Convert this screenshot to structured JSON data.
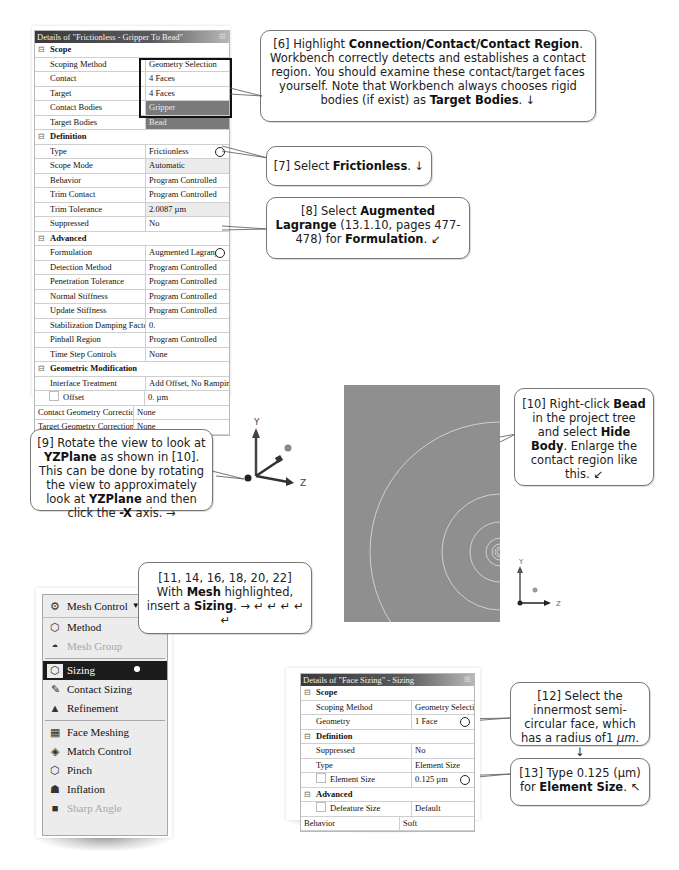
{
  "contact_details": {
    "title": "Details of \"Frictionless - Gripper To Bead\"",
    "sections": [
      {
        "name": "Scope",
        "rows": [
          {
            "key": "Scoping Method",
            "value": "Geometry Selection"
          },
          {
            "key": "Contact",
            "value": "4 Faces"
          },
          {
            "key": "Target",
            "value": "4 Faces"
          },
          {
            "key": "Contact Bodies",
            "value": "Gripper"
          },
          {
            "key": "Target Bodies",
            "value": "Bead"
          }
        ]
      },
      {
        "name": "Definition",
        "rows": [
          {
            "key": "Type",
            "value": "Frictionless"
          },
          {
            "key": "Scope Mode",
            "value": "Automatic"
          },
          {
            "key": "Behavior",
            "value": "Program Controlled"
          },
          {
            "key": "Trim Contact",
            "value": "Program Controlled"
          },
          {
            "key": "Trim Tolerance",
            "value": "2.0087 µm"
          },
          {
            "key": "Suppressed",
            "value": "No"
          }
        ]
      },
      {
        "name": "Advanced",
        "rows": [
          {
            "key": "Formulation",
            "value": "Augmented Lagrange"
          },
          {
            "key": "Detection Method",
            "value": "Program Controlled"
          },
          {
            "key": "Penetration Tolerance",
            "value": "Program Controlled"
          },
          {
            "key": "Normal Stiffness",
            "value": "Program Controlled"
          },
          {
            "key": "Update Stiffness",
            "value": "Program Controlled"
          },
          {
            "key": "Stabilization Damping Factor",
            "value": "0."
          },
          {
            "key": "Pinball Region",
            "value": "Program Controlled"
          },
          {
            "key": "Time Step Controls",
            "value": "None"
          }
        ]
      },
      {
        "name": "Geometric Modification",
        "rows": [
          {
            "key": "Interface Treatment",
            "value": "Add Offset, No Ramping"
          },
          {
            "key": "Offset",
            "value": "0. µm"
          },
          {
            "key": "Contact Geometry Correction",
            "value": "None"
          },
          {
            "key": "Target Geometry Correction",
            "value": "None"
          }
        ]
      }
    ]
  },
  "sizing_details": {
    "title": "Details of \"Face Sizing\" - Sizing",
    "sections": [
      {
        "name": "Scope",
        "rows": [
          {
            "key": "Scoping Method",
            "value": "Geometry Selection"
          },
          {
            "key": "Geometry",
            "value": "1 Face"
          }
        ]
      },
      {
        "name": "Definition",
        "rows": [
          {
            "key": "Suppressed",
            "value": "No"
          },
          {
            "key": "Type",
            "value": "Element Size"
          },
          {
            "key": "Element Size",
            "value": "0.125 µm"
          }
        ]
      },
      {
        "name": "Advanced",
        "rows": [
          {
            "key": "Defeature Size",
            "value": "Default"
          },
          {
            "key": "Behavior",
            "value": "Soft"
          }
        ]
      }
    ]
  },
  "mesh_menu": {
    "header": "Mesh Control",
    "items": [
      {
        "label": "Method",
        "icon": "method-icon",
        "state": "normal"
      },
      {
        "label": "Mesh Group",
        "icon": "mesh-group-icon",
        "state": "disabled"
      },
      {
        "label": "Sizing",
        "icon": "sizing-icon",
        "state": "selected"
      },
      {
        "label": "Contact Sizing",
        "icon": "contact-sizing-icon",
        "state": "normal"
      },
      {
        "label": "Refinement",
        "icon": "refinement-icon",
        "state": "normal"
      },
      {
        "label": "Face Meshing",
        "icon": "face-meshing-icon",
        "state": "normal"
      },
      {
        "label": "Match Control",
        "icon": "match-control-icon",
        "state": "normal"
      },
      {
        "label": "Pinch",
        "icon": "pinch-icon",
        "state": "normal"
      },
      {
        "label": "Inflation",
        "icon": "inflation-icon",
        "state": "normal"
      },
      {
        "label": "Sharp Angle",
        "icon": "sharp-angle-icon",
        "state": "disabled"
      }
    ]
  },
  "axes": {
    "y": "Y",
    "z": "Z"
  },
  "callouts": {
    "c6": {
      "pre": "[6] Highlight ",
      "b1": "Connection/Contact/Contact Region",
      "mid": ". Workbench correctly detects and establishes a contact region. You should examine these contact/target faces yourself.  Note that Workbench always chooses rigid bodies (if exist) as ",
      "b2": "Target Bodies",
      "post": ". ↓"
    },
    "c7": {
      "pre": "[7] Select ",
      "b1": "Frictionless",
      "post": ". ↓"
    },
    "c8": {
      "pre": "[8] Select ",
      "b1": "Augmented Lagrange",
      "mid": " (13.1.10, pages 477-478) for ",
      "b2": "Formulation",
      "post": ". ↙"
    },
    "c9": {
      "pre": "[9] Rotate the view to look at ",
      "b1": "YZPlane",
      "mid": " as shown in [10]. This can be done by rotating the view to approximately look at ",
      "b2": "YZPlane",
      "mid2": " and then click the ",
      "b3": "-X",
      "post": " axis. →"
    },
    "c10": {
      "pre": "[10] Right-click ",
      "b1": "Bead",
      "mid": " in the project tree and select ",
      "b2": "Hide Body",
      "post": ". Enlarge the contact region like this. ↙"
    },
    "c11": {
      "pre": "[11, 14, 16, 18, 20, 22] With ",
      "b1": "Mesh",
      "mid": " highlighted, insert a ",
      "b2": "Sizing",
      "post": ". → ↵ ↵ ↵ ↵ ↵"
    },
    "c12": {
      "pre": "[12] Select the innermost semi-circular face, which has a radius of1 ",
      "unit": "µm",
      "post": ". ↓"
    },
    "c13": {
      "pre": "[13] Type 0.125 (µm) for ",
      "b1": "Element Size",
      "post": ". ↖"
    }
  }
}
